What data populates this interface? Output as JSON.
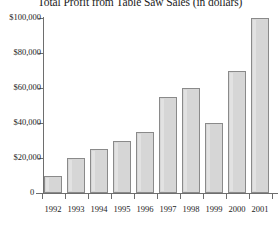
{
  "chart_data": {
    "type": "bar",
    "title": "Total Profit from Table Saw Sales (in dollars)",
    "xlabel": "",
    "ylabel": "",
    "categories": [
      "1992",
      "1993",
      "1994",
      "1995",
      "1996",
      "1997",
      "1998",
      "1999",
      "2000",
      "2001"
    ],
    "values": [
      10000,
      20000,
      25000,
      30000,
      35000,
      55000,
      60000,
      40000,
      70000,
      100000
    ],
    "ylim": [
      0,
      100000
    ],
    "y_ticks": [
      0,
      20000,
      40000,
      60000,
      80000,
      100000
    ],
    "y_tick_labels": [
      "0",
      "$20,000",
      "$40,000",
      "$60,000",
      "$80,000",
      "$100,000"
    ],
    "grid": false,
    "legend": null,
    "bar_fill_color": "#d6d6d6",
    "bar_border_color": "#8a8a8a",
    "axis_color": "#6e6e6e",
    "background_color": "#ffffff",
    "text_color": "#1c1c1c"
  }
}
